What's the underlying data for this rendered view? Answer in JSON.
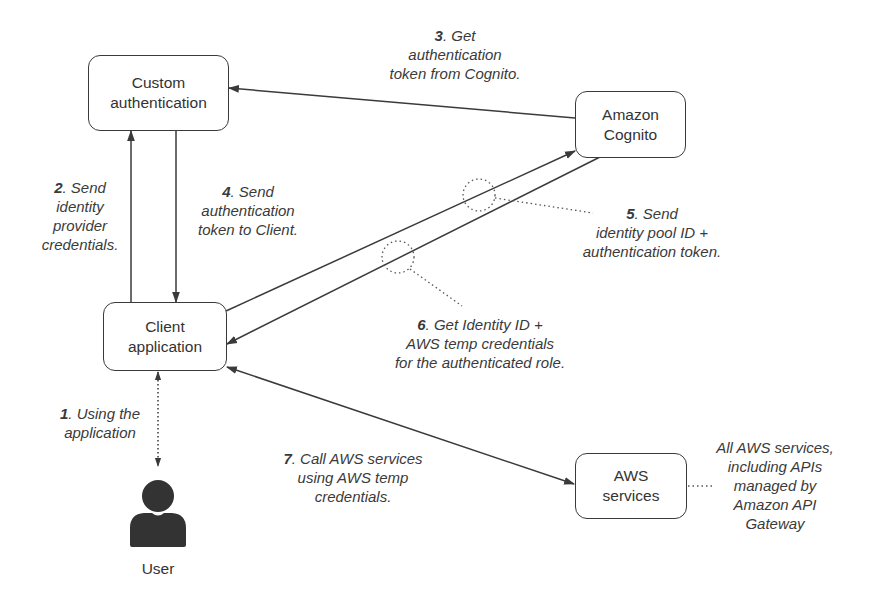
{
  "diagram": {
    "colors": {
      "stroke": "#3a3a3a",
      "text": "#333333",
      "background": "#ffffff"
    },
    "nodes": {
      "custom_auth": {
        "lines": [
          "Custom",
          "authentication"
        ]
      },
      "cognito": {
        "lines": [
          "Amazon",
          "Cognito"
        ]
      },
      "client": {
        "lines": [
          "Client",
          "application"
        ]
      },
      "aws_services": {
        "lines": [
          "AWS",
          "services"
        ]
      },
      "user": {
        "label": "User",
        "icon": "user-icon"
      }
    },
    "steps": [
      {
        "num": "1",
        "lines": [
          ". Using the",
          "application"
        ]
      },
      {
        "num": "2",
        "lines": [
          ". Send",
          "identity",
          "provider",
          "credentials."
        ]
      },
      {
        "num": "3",
        "lines": [
          ". Get",
          "authentication",
          "token from Cognito."
        ]
      },
      {
        "num": "4",
        "lines": [
          ". Send",
          "authentication",
          "token to Client."
        ]
      },
      {
        "num": "5",
        "lines": [
          ". Send",
          "identity pool ID +",
          "authentication token."
        ]
      },
      {
        "num": "6",
        "lines": [
          ". Get Identity ID +",
          "AWS temp credentials",
          "for the authenticated role."
        ]
      },
      {
        "num": "7",
        "lines": [
          ". Call AWS services",
          "using AWS temp",
          "credentials."
        ]
      }
    ],
    "note": {
      "lines": [
        "All AWS services,",
        "including APIs",
        "managed by",
        "Amazon API",
        "Gateway"
      ]
    },
    "edges": [
      {
        "from": "client",
        "to": "custom_auth",
        "step": "2",
        "style": "solid"
      },
      {
        "from": "custom_auth",
        "to": "client",
        "step": "4",
        "style": "solid"
      },
      {
        "from": "cognito",
        "to": "custom_auth",
        "step": "3",
        "style": "solid"
      },
      {
        "from": "client",
        "to": "cognito",
        "step": "5",
        "style": "solid"
      },
      {
        "from": "cognito",
        "to": "client",
        "step": "6",
        "style": "solid"
      },
      {
        "from": "client",
        "to": "aws_services",
        "step": "7",
        "style": "solid",
        "bidirectional": true
      },
      {
        "from": "user",
        "to": "client",
        "step": "1",
        "style": "dotted",
        "bidirectional": true
      }
    ]
  }
}
